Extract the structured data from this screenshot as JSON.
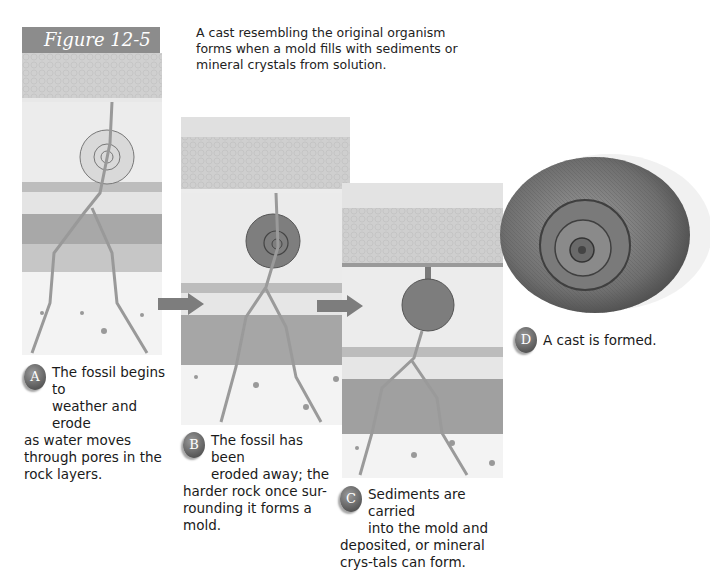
{
  "page": {
    "top_cut_text": "Figure 12-5 cast formation"
  },
  "figure": {
    "label": "Figure 12-5",
    "caption": "A cast resembling the original organism forms when a mold fills with sediments or mineral crystals from solution."
  },
  "steps": [
    {
      "letter": "A",
      "line1": "The fossil begins to",
      "line2": "weather and erode",
      "rest": "as water moves through pores in the rock layers."
    },
    {
      "letter": "B",
      "line1": "The fossil has been",
      "line2": "eroded away; the",
      "rest": "harder rock once sur-rounding it forms a mold."
    },
    {
      "letter": "C",
      "line1": "Sediments are carried",
      "line2": "into the mold and",
      "rest": "deposited, or mineral crys-tals can form."
    },
    {
      "letter": "D",
      "line1": "A cast is formed.",
      "line2": "",
      "rest": ""
    }
  ],
  "icons": {
    "arrow": "right-arrow",
    "badge": "step-letter-badge"
  },
  "colors": {
    "label_band": "#8c8c8c",
    "arrow": "#7d7d7d",
    "badge": "#6a6a6a"
  }
}
